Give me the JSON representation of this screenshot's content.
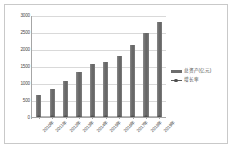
{
  "chart_data": {
    "type": "bar",
    "title": "",
    "subtitle": "",
    "xlabel": "",
    "ylabel": "",
    "categories": [
      "2010年",
      "2011年",
      "2012年",
      "2013年",
      "2014年",
      "2015年",
      "2016年",
      "2017年",
      "2018年",
      "2019年"
    ],
    "series": [
      {
        "name": "总资产(亿元)",
        "type": "bar",
        "color": "#6d6d6d",
        "values": [
          650,
          830,
          1050,
          1320,
          1550,
          1610,
          1800,
          2110,
          2480,
          2800
        ]
      },
      {
        "name": "增长率",
        "type": "line",
        "color": "#4f4f4f",
        "values": [
          0,
          0,
          0,
          0,
          0,
          0,
          0,
          0,
          0,
          0
        ]
      }
    ],
    "yticks": [
      0,
      500,
      1000,
      1500,
      2000,
      2500,
      3000
    ],
    "ytick_labels": [
      "0",
      "500",
      "1000",
      "1500",
      "2000",
      "2500",
      "3000"
    ],
    "ylim": [
      0,
      3000
    ],
    "grid": true,
    "legend_position": "right",
    "legend_entries": [
      "总资产(亿元)",
      "增长率"
    ],
    "annotations": []
  },
  "legend": {
    "items": [
      {
        "label": "总资产(亿元)",
        "marker": "bar-swatch-icon"
      },
      {
        "label": "增长率",
        "marker": "line-marker-icon"
      }
    ]
  },
  "colors": {
    "bar": "#6d6d6d",
    "line": "#4f4f4f",
    "grid": "#d9d9d9",
    "axis": "#a6a6a6",
    "frame": "#c9c9c9",
    "text": "#4a4a4a",
    "background": "#ffffff"
  }
}
